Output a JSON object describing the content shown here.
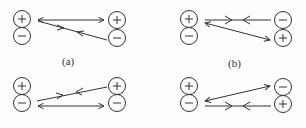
{
  "diagram": {
    "background": "#fdfdfb",
    "stroke": "#333333",
    "panels": [
      {
        "id": "a",
        "label": "(a)",
        "left_charges": [
          "+",
          "−"
        ],
        "right_charges": [
          "+",
          "−"
        ],
        "description": "double arrow between left + and right +; single-flow line from left + to right − with arrows pointing toward each other"
      },
      {
        "id": "b",
        "label": "(b)",
        "left_charges": [
          "+",
          "−"
        ],
        "right_charges": [
          "−",
          "+"
        ],
        "description": "line from left + to right − with arrows pointing toward each other; double arrow between left + and right +"
      },
      {
        "id": "c",
        "label": "",
        "left_charges": [
          "+",
          "−"
        ],
        "right_charges": [
          "+",
          "−"
        ],
        "description": "line from left − to right + with arrows pointing toward each other; double arrow between left − and right −"
      },
      {
        "id": "d",
        "label": "",
        "left_charges": [
          "+",
          "−"
        ],
        "right_charges": [
          "−",
          "+"
        ],
        "description": "double arrow between left − and right −; line from left − to right + with arrows pointing toward each other"
      }
    ]
  }
}
